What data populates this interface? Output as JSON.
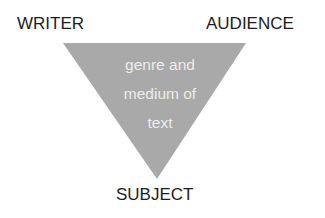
{
  "diagram": {
    "type": "rhetorical-triangle",
    "labels": {
      "top_left": "WRITER",
      "top_right": "AUDIENCE",
      "bottom": "SUBJECT"
    },
    "center": {
      "lines": [
        "genre and",
        "medium of",
        "text"
      ]
    },
    "colors": {
      "triangle_fill": "#a9a9a9",
      "center_text": "#ececec",
      "label_text": "#1c1c1c",
      "background": "#ffffff"
    }
  }
}
